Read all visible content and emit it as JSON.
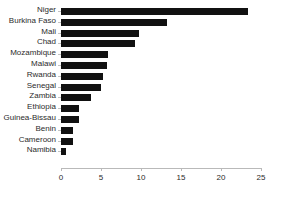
{
  "chart_data": {
    "type": "bar",
    "orientation": "horizontal",
    "title": "",
    "xlabel": "",
    "ylabel": "",
    "xlim": [
      0,
      25
    ],
    "xticks": [
      0,
      5,
      10,
      15,
      20,
      25
    ],
    "grid": false,
    "legend": null,
    "bar_color": "#111111",
    "axis_color": "#b9b9b9",
    "background": "#ffffff",
    "categories": [
      "Niger",
      "Burkina Faso",
      "Mali",
      "Chad",
      "Mozambique",
      "Malawi",
      "Rwanda",
      "Senegal",
      "Zambia",
      "Ethiopia",
      "Guinea-Bissau",
      "Benin",
      "Cameroon",
      "Namibia"
    ],
    "values": [
      23.4,
      13.2,
      9.8,
      9.2,
      5.9,
      5.8,
      5.3,
      5.0,
      3.8,
      2.3,
      2.2,
      1.5,
      1.5,
      0.6
    ]
  },
  "caption": ""
}
